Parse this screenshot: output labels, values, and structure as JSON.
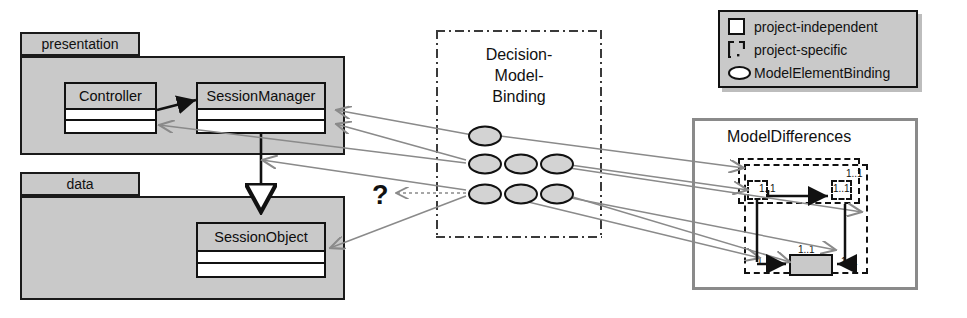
{
  "diagram": {
    "colors": {
      "package_fill": "#c9c9c9",
      "class_name_fill": "#c9c9c9",
      "compartment_fill": "#ffffff",
      "outline": "#111111",
      "binding_ellipse_fill": "#d3d3d3",
      "connector_gray": "#8a8a8a",
      "md_border": "#8a8a8a",
      "legend_fill": "#c9c9c9"
    }
  },
  "packages": [
    {
      "name": "presentation",
      "classes": [
        {
          "name": "Controller",
          "compartments": 2
        },
        {
          "name": "SessionManager",
          "compartments": 2
        }
      ]
    },
    {
      "name": "data",
      "classes": [
        {
          "name": "SessionObject",
          "compartments": 2
        }
      ]
    }
  ],
  "decision_model_binding": {
    "title_lines": [
      "Decision-",
      "Model-",
      "Binding"
    ],
    "binding_rows": [
      {
        "count": 1
      },
      {
        "count": 3
      },
      {
        "count": 3
      }
    ],
    "total_bindings": 7
  },
  "unknown_marker": {
    "label": "?"
  },
  "legend": {
    "items": [
      {
        "icon": "square-icon",
        "label": "project-independent"
      },
      {
        "icon": "dashed-bracket-icon",
        "label": "project-specific"
      },
      {
        "icon": "ellipse-icon",
        "label": "ModelElementBinding"
      }
    ]
  },
  "model_differences": {
    "title": "ModelDifferences",
    "multiplicities": [
      "1..1",
      "1..1",
      "1..1",
      "1..1",
      "1..1",
      "1..1"
    ],
    "elements": [
      {
        "kind": "project-specific",
        "shape": "dashed"
      },
      {
        "kind": "project-specific",
        "shape": "dashed"
      },
      {
        "kind": "project-specific",
        "shape": "dashed"
      },
      {
        "kind": "project-specific",
        "shape": "dashed"
      },
      {
        "kind": "project-independent",
        "shape": "solid-filled"
      }
    ]
  }
}
